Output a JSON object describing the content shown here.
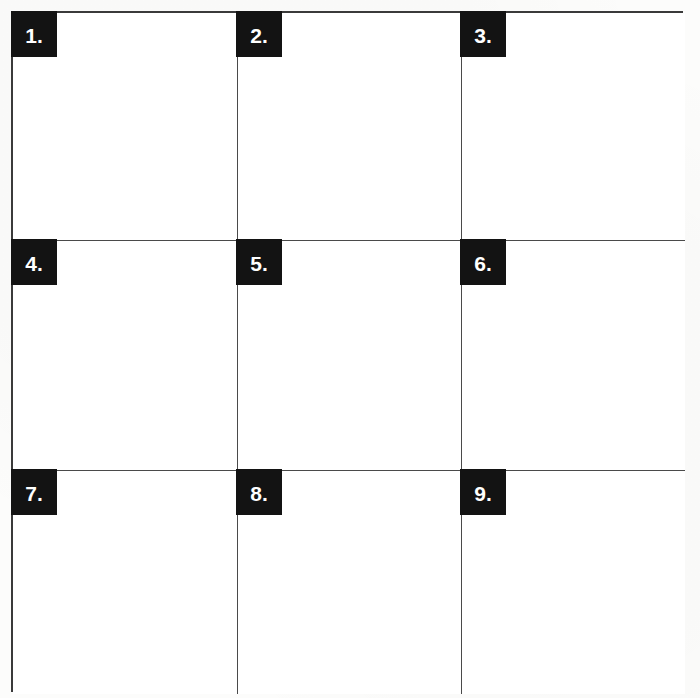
{
  "sheet": {
    "title": "Numbered 3x3 Answer Grid",
    "rows": 3,
    "columns": 3,
    "cell_count": 9,
    "border_color": "#3a3a3a",
    "divider_color": "#4a4a4a",
    "label_background": "#131313",
    "label_text_color": "#ffffff",
    "page_background": "#fcfcfb",
    "cell_background": "#ffffff"
  },
  "cells": [
    {
      "label": "1.",
      "number": 1,
      "content": "",
      "row": 1,
      "col": 1
    },
    {
      "label": "2.",
      "number": 2,
      "content": "",
      "row": 1,
      "col": 2
    },
    {
      "label": "3.",
      "number": 3,
      "content": "",
      "row": 1,
      "col": 3
    },
    {
      "label": "4.",
      "number": 4,
      "content": "",
      "row": 2,
      "col": 1
    },
    {
      "label": "5.",
      "number": 5,
      "content": "",
      "row": 2,
      "col": 2
    },
    {
      "label": "6.",
      "number": 6,
      "content": "",
      "row": 2,
      "col": 3
    },
    {
      "label": "7.",
      "number": 7,
      "content": "",
      "row": 3,
      "col": 1
    },
    {
      "label": "8.",
      "number": 8,
      "content": "",
      "row": 3,
      "col": 2
    },
    {
      "label": "9.",
      "number": 9,
      "content": "",
      "row": 3,
      "col": 3
    }
  ]
}
